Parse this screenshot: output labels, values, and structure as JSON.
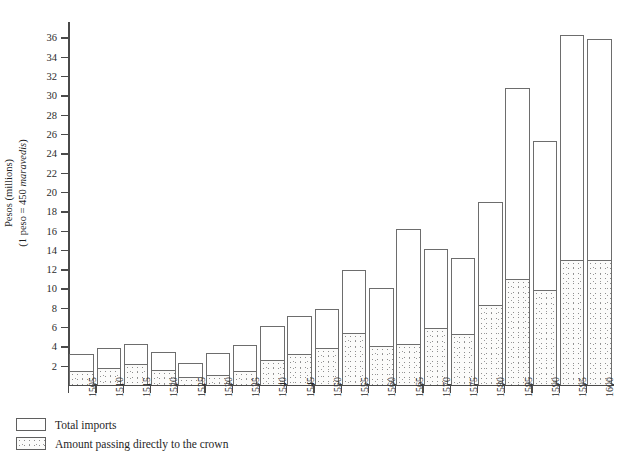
{
  "chart_data": {
    "type": "bar",
    "title": "",
    "subtitle": "",
    "xlabel": "",
    "ylabel": "Pesos (millions) (1 peso = 450 maravedis)",
    "ylabel_line1": "Pesos (millions)",
    "ylabel_line2_prefix": "(1 peso = 450 ",
    "ylabel_line2_italic": "maravedis",
    "ylabel_line2_suffix": ")",
    "categories": [
      "1505",
      "1510",
      "1515",
      "1520",
      "1525",
      "1530",
      "1535",
      "1540",
      "1545",
      "1550",
      "1555",
      "1560",
      "1565",
      "1570",
      "1575",
      "1580",
      "1585",
      "1590",
      "1595",
      "1600"
    ],
    "series": [
      {
        "name": "Total imports",
        "values": [
          3.2,
          3.8,
          4.2,
          3.4,
          2.3,
          3.35,
          4.1,
          6.1,
          7.1,
          7.9,
          11.9,
          10.1,
          16.2,
          14.1,
          13.2,
          19.0,
          30.8,
          25.3,
          36.3,
          35.8
        ]
      },
      {
        "name": "Amount passing directly to the crown",
        "values": [
          1.4,
          1.8,
          2.2,
          1.6,
          0.8,
          1.0,
          1.5,
          2.6,
          3.2,
          3.8,
          5.4,
          4.0,
          4.2,
          5.9,
          5.3,
          8.3,
          11.0,
          9.8,
          13.0,
          13.0
        ]
      }
    ],
    "yticks": [
      2,
      4,
      6,
      8,
      10,
      12,
      14,
      16,
      18,
      20,
      22,
      24,
      26,
      28,
      30,
      32,
      34,
      36
    ],
    "ylim": [
      0,
      37.6
    ],
    "grid": false,
    "legend_position": "bottom-left",
    "stacked": false,
    "note": "Each year shows total imports as an outline bar with the crown's share shaded (stippled) from the baseline."
  },
  "legend": {
    "items": [
      {
        "label": "Total imports",
        "swatch": "outline-white"
      },
      {
        "label": "Amount passing directly to the crown",
        "swatch": "stippled-gray"
      }
    ]
  },
  "colors": {
    "bar_outline": "#6d6d6d",
    "axis": "#4a4a4a",
    "text": "#1f1f1f",
    "background": "#ffffff",
    "stipple": "#9a9a9a"
  },
  "caption": ""
}
